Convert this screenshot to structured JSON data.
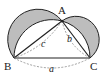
{
  "diagram": {
    "type": "lunes-of-hippocrates",
    "points": {
      "A": {
        "label": "A",
        "x": 62,
        "y": 21
      },
      "B": {
        "label": "B",
        "x": 14,
        "y": 58
      },
      "C": {
        "label": "C",
        "x": 90,
        "y": 58
      }
    },
    "sides": {
      "a": {
        "label": "a",
        "between": [
          "B",
          "C"
        ]
      },
      "b": {
        "label": "b",
        "between": [
          "A",
          "C"
        ]
      },
      "c": {
        "label": "c",
        "between": [
          "A",
          "B"
        ]
      }
    },
    "colors": {
      "lune_fill": "#bdbdbd",
      "stroke": "#222222",
      "dashed": "#777777",
      "background": "#ffffff"
    }
  }
}
